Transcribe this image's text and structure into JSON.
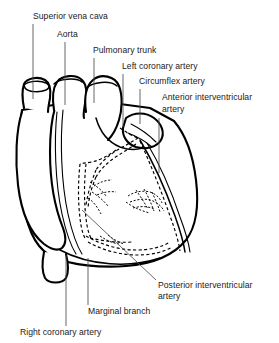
{
  "figure": {
    "background_color": "#ffffff",
    "line_color": "#000000",
    "leader_color": "#4d4d4d",
    "text_color": "#1a1a1a",
    "width": 279,
    "height": 343
  },
  "labels": [
    {
      "id": "superior-vena-cava",
      "lines": [
        "Superior vena cava"
      ],
      "text_x": 33,
      "text_y": 19,
      "leader": {
        "type": "vertical",
        "x": 33,
        "y1": 24,
        "y2": 99
      }
    },
    {
      "id": "aorta",
      "lines": [
        "Aorta"
      ],
      "text_x": 57,
      "text_y": 37,
      "leader": {
        "type": "vertical",
        "x": 65,
        "y1": 42,
        "y2": 105
      }
    },
    {
      "id": "pulmonary-trunk",
      "lines": [
        "Pulmonary trunk"
      ],
      "text_x": 93,
      "text_y": 53,
      "leader": {
        "type": "vertical",
        "x": 94,
        "y1": 58,
        "y2": 103
      }
    },
    {
      "id": "left-coronary-artery",
      "lines": [
        "Left coronary artery"
      ],
      "text_x": 122,
      "text_y": 69,
      "leader": {
        "type": "vertical",
        "x": 123,
        "y1": 74,
        "y2": 127
      }
    },
    {
      "id": "circumflex-artery",
      "lines": [
        "Circumflex artery"
      ],
      "text_x": 139,
      "text_y": 84,
      "leader": {
        "type": "vertical",
        "x": 140,
        "y1": 89,
        "y2": 124
      }
    },
    {
      "id": "anterior-interventricular-artery",
      "lines": [
        "Anterior interventricular",
        "artery"
      ],
      "text_x": 162,
      "text_y": 100,
      "leader": {
        "type": "vertical",
        "x": 159,
        "y1": 118,
        "y2": 173
      }
    },
    {
      "id": "posterior-interventricular-artery",
      "lines": [
        "Posterior interventricular",
        "artery"
      ],
      "text_x": 158,
      "text_y": 288,
      "leader": {
        "type": "diagonal",
        "x1": 82,
        "y1": 210,
        "x2": 156,
        "y2": 280
      }
    },
    {
      "id": "marginal-branch",
      "lines": [
        "Marginal branch"
      ],
      "text_x": 88,
      "text_y": 314,
      "leader": {
        "type": "vertical",
        "x": 88,
        "y1": 258,
        "y2": 305
      }
    },
    {
      "id": "right-coronary-artery",
      "lines": [
        "Right coronary artery"
      ],
      "text_x": 20,
      "text_y": 335,
      "leader": {
        "type": "vertical",
        "x": 66,
        "y1": 255,
        "y2": 326
      }
    }
  ],
  "diagram": {
    "name": "heart-anterior-view",
    "parts": [
      {
        "id": "superior-vena-cava-vessel",
        "kind": "great-vessel"
      },
      {
        "id": "aorta-vessel",
        "kind": "great-vessel"
      },
      {
        "id": "pulmonary-trunk-vessel",
        "kind": "great-vessel"
      },
      {
        "id": "right-atrium",
        "kind": "chamber"
      },
      {
        "id": "right-ventricle",
        "kind": "chamber"
      },
      {
        "id": "left-ventricle",
        "kind": "chamber"
      },
      {
        "id": "left-auricle",
        "kind": "chamber"
      },
      {
        "id": "right-coronary-artery-vessel",
        "kind": "artery-dashed"
      },
      {
        "id": "left-coronary-artery-vessel",
        "kind": "artery-dashed"
      },
      {
        "id": "circumflex-artery-vessel",
        "kind": "artery-dashed"
      },
      {
        "id": "anterior-interventricular-artery-vessel",
        "kind": "artery-solid"
      },
      {
        "id": "posterior-interventricular-artery-vessel",
        "kind": "artery-dashed"
      },
      {
        "id": "marginal-branch-vessel",
        "kind": "artery-dashed"
      }
    ]
  }
}
